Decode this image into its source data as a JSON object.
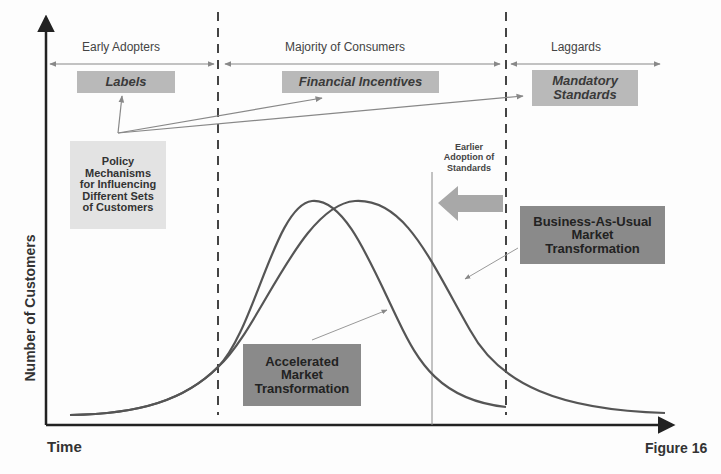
{
  "title_cut": "",
  "segments": {
    "early": "Early Adopters",
    "majority": "Majority of Consumers",
    "laggards": "Laggards"
  },
  "policy_boxes": {
    "labels": "Labels",
    "financial": "Financial Incentives",
    "mandatory_line1": "Mandatory",
    "mandatory_line2": "Standards"
  },
  "policy_note": {
    "line1": "Policy",
    "line2": "Mechanisms",
    "line3": "for Influencing",
    "line4": "Different Sets",
    "line5": "of Customers"
  },
  "earlier_adoption": {
    "line1": "Earlier",
    "line2": "Adoption of",
    "line3": "Standards"
  },
  "bau_box": {
    "line1": "Business-As-Usual",
    "line2": "Market",
    "line3": "Transformation"
  },
  "accel_box": {
    "line1": "Accelerated",
    "line2": "Market",
    "line3": "Transformation"
  },
  "axes": {
    "y_label": "Number of Customers",
    "x_label": "Time"
  },
  "figure_label": "Figure 16",
  "colors": {
    "box_light": "#b9b9b9",
    "box_dark": "#8a8a8a",
    "note_bg": "#e3e3e3",
    "arrow_fill": "#a8a8a8",
    "curve": "#555555",
    "axis": "#222222"
  }
}
